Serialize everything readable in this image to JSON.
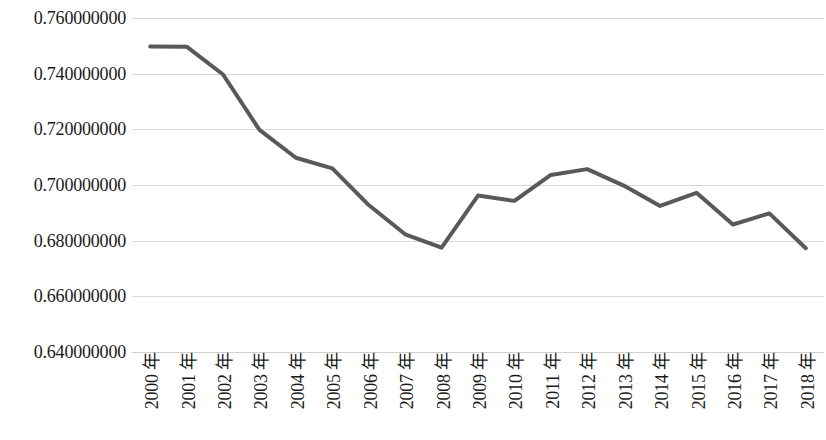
{
  "chart_data": {
    "type": "line",
    "title": "",
    "subtitle": "",
    "xlabel": "",
    "ylabel": "",
    "categories": [
      "2000 年",
      "2001 年",
      "2002 年",
      "2003 年",
      "2004 年",
      "2005 年",
      "2006 年",
      "2007 年",
      "2008 年",
      "2009 年",
      "2010 年",
      "2011 年",
      "2012 年",
      "2013 年",
      "2014 年",
      "2015 年",
      "2016 年",
      "2017 年",
      "2018 年"
    ],
    "x": [
      2000,
      2001,
      2002,
      2003,
      2004,
      2005,
      2006,
      2007,
      2008,
      2009,
      2010,
      2011,
      2012,
      2013,
      2014,
      2015,
      2016,
      2017,
      2018
    ],
    "values": [
      0.7498,
      0.7497,
      0.7397,
      0.7198,
      0.7098,
      0.706,
      0.6928,
      0.6823,
      0.6775,
      0.6962,
      0.6943,
      0.7036,
      0.7057,
      0.6998,
      0.6925,
      0.6972,
      0.6858,
      0.6898,
      0.6773
    ],
    "series": [
      {
        "name": "",
        "color": "#595959",
        "values": [
          0.7498,
          0.7497,
          0.7397,
          0.7198,
          0.7098,
          0.706,
          0.6928,
          0.6823,
          0.6775,
          0.6962,
          0.6943,
          0.7036,
          0.7057,
          0.6998,
          0.6925,
          0.6972,
          0.6858,
          0.6898,
          0.6773
        ]
      }
    ],
    "ylim": [
      0.64,
      0.76
    ],
    "yticks": [
      0.64,
      0.66,
      0.68,
      0.7,
      0.72,
      0.74,
      0.76
    ],
    "ytick_labels": [
      "0.640000000",
      "0.660000000",
      "0.680000000",
      "0.700000000",
      "0.720000000",
      "0.740000000",
      "0.760000000"
    ],
    "grid": true,
    "grid_color": "#d9d9d9",
    "legend": "none",
    "line_width": 4,
    "background_color": "#ffffff"
  }
}
